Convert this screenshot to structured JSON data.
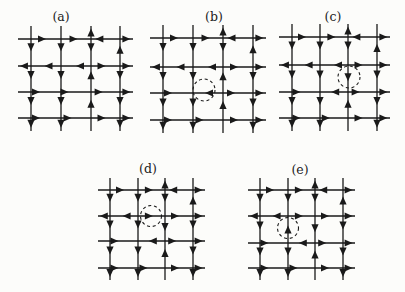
{
  "figure": {
    "background": "#fcfcfa",
    "ink": "#1a1a1a",
    "panels": [
      {
        "id": "a",
        "label": "(a)",
        "label_pos": [
          61,
          17
        ],
        "cols": [
          31,
          61,
          91,
          120
        ],
        "rows": [
          39,
          66,
          92,
          118
        ],
        "stub": 13,
        "circle": null,
        "h_arrows": [
          [
            "",
            "R@0.5",
            "R@0.55",
            "L@0.15",
            "R@0.8"
          ],
          [
            "L@0.15",
            "L@0.45",
            "L@0.5",
            "R@0.5",
            "R@0.8"
          ],
          [
            "",
            "R@0.3",
            "R@0.25",
            "R@0.4",
            "R@0.8"
          ],
          [
            "",
            "R@0.3",
            "R@0.35",
            "R@0.5",
            "R@0.8"
          ]
        ],
        "v_arrows": [
          [
            "",
            "D@0.45",
            "D@0.5",
            "D@0.5",
            "D@0.75"
          ],
          [
            "",
            "D@0.45",
            "D@0.5",
            "D@0.5",
            "D@0.75"
          ],
          [
            "U@0.2",
            "D@0.45",
            "U@0.2",
            "U@0.3",
            ""
          ],
          [
            "",
            "U@0.25",
            "D@0.5",
            "D@0.5",
            "D@0.75"
          ]
        ]
      },
      {
        "id": "b",
        "label": "(b)",
        "label_pos": [
          214,
          17
        ],
        "cols": [
          163,
          193,
          223,
          253
        ],
        "rows": [
          38,
          67,
          93,
          120
        ],
        "stub": 13,
        "circle": {
          "cx": 204,
          "cy": 90,
          "r": 11
        },
        "h_arrows": [
          [
            "",
            "R@0.5",
            "R@0.55",
            "L@0.15",
            "R@0.8"
          ],
          [
            "L@0.15",
            "L@0.45",
            "L@0.5",
            "R@0.5",
            "R@0.8"
          ],
          [
            "",
            "R@0.3",
            "L@0.4",
            "R@0.4",
            "R@0.8"
          ],
          [
            "",
            "R@0.3",
            "R@0.35",
            "R@0.5",
            "R@0.8"
          ]
        ],
        "v_arrows": [
          [
            "",
            "D@0.45",
            "D@0.5",
            "D@0.5",
            "D@0.75"
          ],
          [
            "",
            "D@0.45",
            "D@0.5",
            "D@0.5",
            "D@0.75"
          ],
          [
            "U@0.2",
            "D@0.45",
            "U@0.2",
            "U@0.3",
            ""
          ],
          [
            "",
            "U@0.25",
            "D@0.5",
            "D@0.5",
            "D@0.75"
          ]
        ]
      },
      {
        "id": "c",
        "label": "(c)",
        "label_pos": [
          333,
          17
        ],
        "cols": [
          292,
          320,
          348,
          377
        ],
        "rows": [
          37,
          65,
          92,
          118
        ],
        "stub": 13,
        "circle": {
          "cx": 349,
          "cy": 77,
          "r": 11
        },
        "h_arrows": [
          [
            "",
            "R@0.5",
            "R@0.55",
            "L@0.15",
            "R@0.8"
          ],
          [
            "L@0.15",
            "L@0.45",
            "L@0.5",
            "R@0.5",
            "R@0.8"
          ],
          [
            "",
            "R@0.3",
            "L@0.4",
            "R@0.4",
            "R@0.8"
          ],
          [
            "",
            "R@0.3",
            "R@0.35",
            "R@0.5",
            "R@0.8"
          ]
        ],
        "v_arrows": [
          [
            "",
            "D@0.45",
            "D@0.5",
            "D@0.5",
            "D@0.75"
          ],
          [
            "",
            "D@0.45",
            "D@0.5",
            "D@0.5",
            "D@0.75"
          ],
          [
            "U@0.2",
            "D@0.45",
            "D@0.6",
            "U@0.3",
            ""
          ],
          [
            "",
            "U@0.25",
            "D@0.5",
            "D@0.5",
            "D@0.75"
          ]
        ]
      },
      {
        "id": "d",
        "label": "(d)",
        "label_pos": [
          148,
          169
        ],
        "cols": [
          110,
          138,
          165,
          193
        ],
        "rows": [
          190,
          216,
          241,
          268
        ],
        "stub": 12,
        "circle": {
          "cx": 151,
          "cy": 216,
          "r": 10.5
        },
        "h_arrows": [
          [
            "",
            "R@0.5",
            "R@0.55",
            "L@0.15",
            "R@0.8"
          ],
          [
            "L@0.15",
            "L@0.45",
            "R@0.55",
            "R@0.5",
            "R@0.8"
          ],
          [
            "",
            "R@0.3",
            "L@0.4",
            "R@0.4",
            "R@0.8"
          ],
          [
            "",
            "R@0.3",
            "R@0.35",
            "R@0.5",
            "R@0.8"
          ]
        ],
        "v_arrows": [
          [
            "",
            "D@0.45",
            "D@0.5",
            "D@0.5",
            "D@0.75"
          ],
          [
            "",
            "D@0.45",
            "D@0.5",
            "D@0.5",
            "D@0.75"
          ],
          [
            "U@0.2",
            "D@0.45",
            "D@0.6",
            "U@0.3",
            ""
          ],
          [
            "",
            "U@0.25",
            "D@0.5",
            "D@0.5",
            "D@0.75"
          ]
        ]
      },
      {
        "id": "e",
        "label": "(e)",
        "label_pos": [
          300,
          170
        ],
        "cols": [
          260,
          288,
          315,
          343
        ],
        "rows": [
          190,
          216,
          243,
          268
        ],
        "stub": 12,
        "circle": {
          "cx": 288,
          "cy": 228,
          "r": 10.5
        },
        "h_arrows": [
          [
            "",
            "R@0.5",
            "R@0.55",
            "L@0.15",
            "R@0.8"
          ],
          [
            "L@0.15",
            "L@0.45",
            "R@0.55",
            "R@0.5",
            "R@0.8"
          ],
          [
            "",
            "R@0.3",
            "L@0.4",
            "R@0.4",
            "R@0.8"
          ],
          [
            "",
            "R@0.3",
            "R@0.35",
            "R@0.5",
            "R@0.8"
          ]
        ],
        "v_arrows": [
          [
            "",
            "D@0.45",
            "D@0.5",
            "D@0.5",
            "D@0.75"
          ],
          [
            "",
            "D@0.45",
            "U@0.35",
            "D@0.5",
            "D@0.75"
          ],
          [
            "U@0.2",
            "D@0.45",
            "D@0.6",
            "U@0.3",
            ""
          ],
          [
            "",
            "U@0.25",
            "D@0.5",
            "D@0.5",
            "D@0.75"
          ]
        ]
      }
    ]
  }
}
